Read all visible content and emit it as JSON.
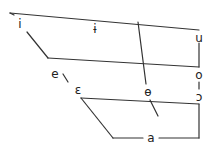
{
  "chart_data": {
    "type": "diagram",
    "title": "",
    "vowels": [
      {
        "symbol": "i",
        "x": 20,
        "y": 24
      },
      {
        "symbol": "ɨ",
        "x": 95,
        "y": 29
      },
      {
        "symbol": "u",
        "x": 199,
        "y": 38
      },
      {
        "symbol": "e",
        "x": 55,
        "y": 74
      },
      {
        "symbol": "o",
        "x": 199,
        "y": 75
      },
      {
        "symbol": "ɛ",
        "x": 78,
        "y": 90
      },
      {
        "symbol": "ɵ",
        "x": 148,
        "y": 92
      },
      {
        "symbol": "ɔ",
        "x": 199,
        "y": 97
      },
      {
        "symbol": "a",
        "x": 151,
        "y": 138
      }
    ],
    "lines": [
      {
        "x1": 10,
        "y1": 13,
        "x2": 199,
        "y2": 30
      },
      {
        "x1": 10,
        "y1": 13,
        "x2": 14,
        "y2": 15
      },
      {
        "x1": 27,
        "y1": 32,
        "x2": 48,
        "y2": 58
      },
      {
        "x1": 48,
        "y1": 58,
        "x2": 199,
        "y2": 67
      },
      {
        "x1": 199,
        "y1": 43,
        "x2": 199,
        "y2": 67
      },
      {
        "x1": 199,
        "y1": 82,
        "x2": 199,
        "y2": 89
      },
      {
        "x1": 63,
        "y1": 74,
        "x2": 68,
        "y2": 82
      },
      {
        "x1": 81,
        "y1": 98,
        "x2": 199,
        "y2": 104
      },
      {
        "x1": 81,
        "y1": 98,
        "x2": 113,
        "y2": 138
      },
      {
        "x1": 113,
        "y1": 138,
        "x2": 143,
        "y2": 138
      },
      {
        "x1": 159,
        "y1": 138,
        "x2": 199,
        "y2": 138
      },
      {
        "x1": 199,
        "y1": 104,
        "x2": 199,
        "y2": 138
      },
      {
        "x1": 138,
        "y1": 22,
        "x2": 146,
        "y2": 84
      },
      {
        "x1": 150,
        "y1": 100,
        "x2": 158,
        "y2": 116
      }
    ]
  }
}
